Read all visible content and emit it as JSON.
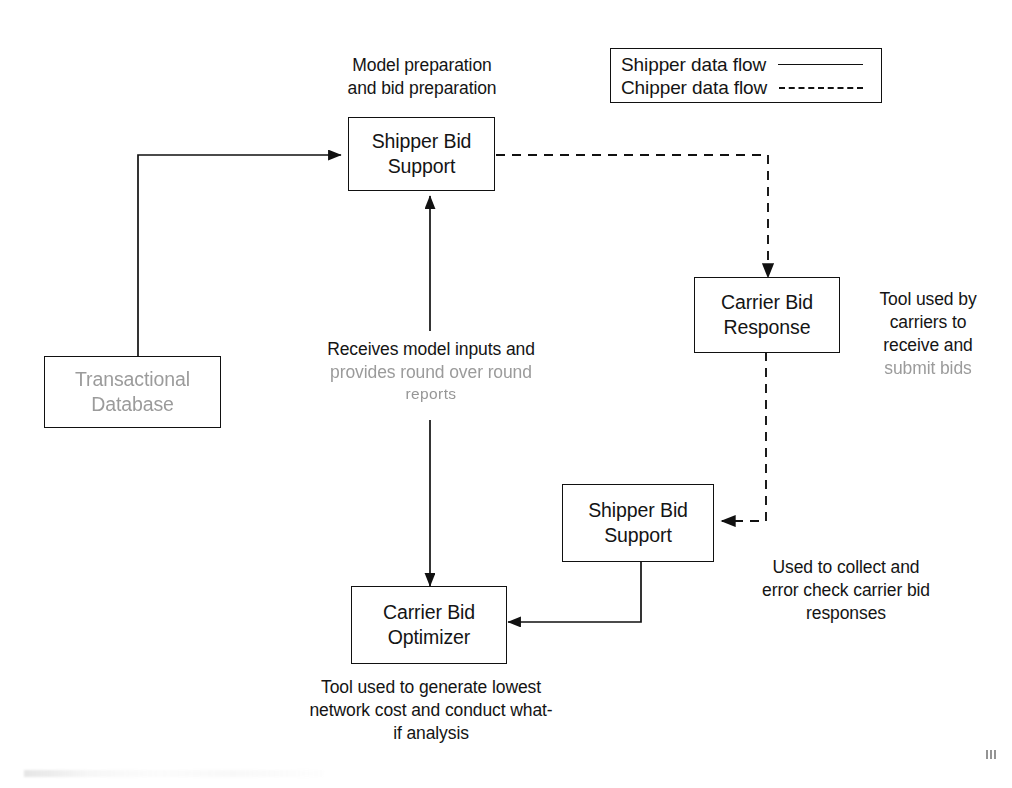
{
  "diagram": {
    "line_color": "#111111",
    "background": "#ffffff"
  },
  "legend": {
    "name": "flow-legend",
    "rows": [
      {
        "label": "Shipper data flow",
        "style": "solid"
      },
      {
        "label": "Chipper data flow",
        "style": "dashed"
      }
    ]
  },
  "nodes": {
    "shipper_bid_support_top": {
      "line1": "Shipper Bid",
      "line2": "Support"
    },
    "transactional_database": {
      "line1": "Transactional",
      "line2": "Database"
    },
    "carrier_bid_response": {
      "line1": "Carrier Bid",
      "line2": "Response"
    },
    "shipper_bid_support_lower": {
      "line1": "Shipper Bid",
      "line2": "Support"
    },
    "carrier_bid_optimizer": {
      "line1": "Carrier Bid",
      "line2": "Optimizer"
    }
  },
  "notes": {
    "model_preparation": {
      "line1": "Model preparation",
      "line2": "and bid preparation"
    },
    "receives_model_inputs": {
      "line1": "Receives model inputs and",
      "line2": "provides round over round",
      "line3": "reports"
    },
    "tool_used_by_carriers": {
      "line1": "Tool used by",
      "line2": "carriers to",
      "line3": "receive and",
      "line4": "submit bids"
    },
    "used_to_collect": {
      "line1": "Used to collect and",
      "line2": "error check carrier bid",
      "line3": "responses"
    },
    "tool_used_to_generate": {
      "line1": "Tool used to generate lowest",
      "line2": "network cost and conduct what-",
      "line3": "if analysis"
    }
  },
  "edges": [
    {
      "name": "database-to-shipper-bid-support",
      "style": "solid",
      "from": "transactional-database",
      "to": "shipper-bid-support-top"
    },
    {
      "name": "shipper-bid-support-to-carrier-bid-response",
      "style": "dashed",
      "from": "shipper-bid-support-top",
      "to": "carrier-bid-response"
    },
    {
      "name": "carrier-bid-response-to-shipper-bid-support-lower",
      "style": "dashed",
      "from": "carrier-bid-response",
      "to": "shipper-bid-support-lower"
    },
    {
      "name": "shipper-bid-support-lower-to-carrier-bid-optimizer",
      "style": "solid",
      "from": "shipper-bid-support-lower",
      "to": "carrier-bid-optimizer"
    },
    {
      "name": "optimizer-shipper-bid-support-bidirectional",
      "style": "solid",
      "from": "carrier-bid-optimizer",
      "to": "shipper-bid-support-top"
    }
  ]
}
